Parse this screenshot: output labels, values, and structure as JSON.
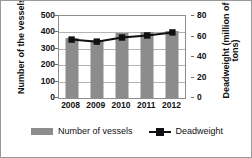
{
  "chart_data": {
    "type": "bar",
    "title": "",
    "categories": [
      "2008",
      "2009",
      "2010",
      "2011",
      "2012"
    ],
    "series": [
      {
        "name": "Number of vessels",
        "type": "bar",
        "axis": "left",
        "color": "#8c8c8c",
        "values": [
          364,
          356,
          395,
          400,
          406
        ]
      },
      {
        "name": "Deadweight",
        "type": "line",
        "axis": "right",
        "color": "#111111",
        "marker": "square",
        "values": [
          57,
          55,
          59,
          61,
          64
        ]
      }
    ],
    "xlabel": "",
    "ylabel": "Number of the vessels",
    "y2label": "Deadweight (million of tons)",
    "ylim": [
      0,
      500
    ],
    "y2lim": [
      0,
      80
    ],
    "yticks": [
      "500",
      "400",
      "300",
      "200",
      "100",
      "0"
    ],
    "y2ticks": [
      "80",
      "60",
      "40",
      "20",
      "0"
    ],
    "grid": true,
    "legend_position": "bottom"
  },
  "axes": {
    "left_title": "Number of the vessels",
    "right_title": "Deadweight (million of tons)",
    "left_ticks": [
      "500",
      "400",
      "300",
      "200",
      "100",
      "0"
    ],
    "right_ticks": [
      "80",
      "60",
      "40",
      "20",
      "0"
    ],
    "x_ticks": [
      "2008",
      "2009",
      "2010",
      "2011",
      "2012"
    ]
  },
  "legend": {
    "items": [
      {
        "label": "Number of vessels",
        "marker": "bar-swatch",
        "color": "#8c8c8c"
      },
      {
        "label": "Deadweight",
        "marker": "line-square-swatch",
        "color": "#111111"
      }
    ]
  }
}
